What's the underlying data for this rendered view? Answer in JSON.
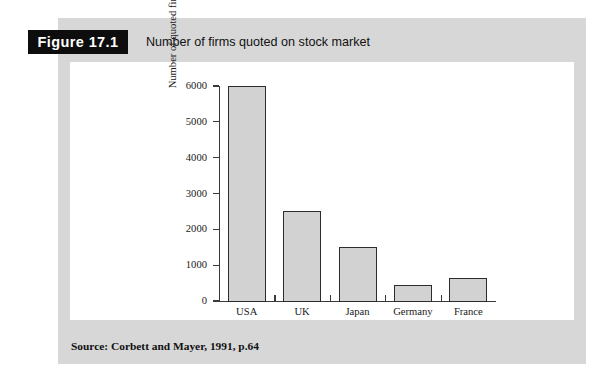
{
  "figure": {
    "badge": "Figure 17.1",
    "caption": "Number of firms quoted on stock market",
    "source": "Source: Corbett and Mayer, 1991, p.64"
  },
  "colors": {
    "panel_background": "#d7d7d7",
    "card_background": "#ffffff",
    "badge_background": "#0d0d0d",
    "badge_text": "#ffffff",
    "bar_fill": "#d2d2d2",
    "bar_stroke": "#2c2c2c",
    "axis": "#3a3a3a",
    "text": "#1a1a1a"
  },
  "chart_data": {
    "type": "bar",
    "title": "Number of firms quoted on stock market",
    "categories": [
      "USA",
      "UK",
      "Japan",
      "Germany",
      "France"
    ],
    "values": [
      6000,
      2500,
      1500,
      450,
      650
    ],
    "xlabel": "",
    "ylabel": "Number of quoted firms",
    "ylim": [
      0,
      6000
    ],
    "yticks": [
      0,
      1000,
      2000,
      3000,
      4000,
      5000,
      6000
    ],
    "ytick_labels": [
      "0",
      "1000",
      "2000",
      "3000",
      "4000",
      "5000",
      "6000"
    ],
    "grid": false,
    "legend": false,
    "source": "Source: Corbett and Mayer, 1991, p.64"
  }
}
